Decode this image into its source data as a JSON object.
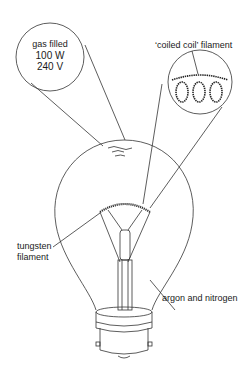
{
  "diagram": {
    "type": "labelled illustration",
    "inset_left": {
      "lines": [
        "gas filled",
        "100 W",
        "240 V"
      ]
    },
    "inset_right": {
      "label": "‘coiled coil’ filament"
    },
    "labels": {
      "tungsten_line1": "tungsten",
      "tungsten_line2": "filament",
      "gas": "argon and nitrogen"
    },
    "colors": {
      "line": "#333333",
      "text": "#1a1a1a",
      "background": "#ffffff"
    }
  }
}
